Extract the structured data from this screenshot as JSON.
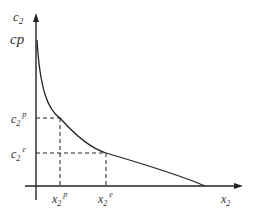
{
  "diagram": {
    "type": "economics-curve",
    "axes": {
      "y_label": "c",
      "y_label_sub": "2",
      "x_label": "x",
      "x_label_sub": "2",
      "y_intercept_label": "cp"
    },
    "points": [
      {
        "name": "p",
        "y_label": "c",
        "y_sub": "2",
        "y_sup": "p",
        "x_label": "x",
        "x_sub": "2",
        "x_sup": "p"
      },
      {
        "name": "e",
        "y_label": "c",
        "y_sub": "2",
        "y_sup": "e",
        "x_label": "x",
        "x_sub": "2",
        "x_sup": "e"
      }
    ],
    "colors": {
      "line": "#222222",
      "text": "#333333"
    }
  }
}
